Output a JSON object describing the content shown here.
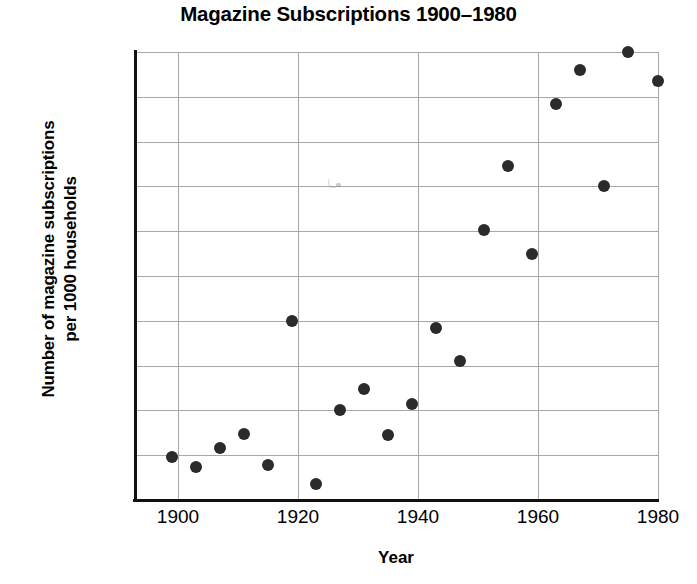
{
  "chart_data": {
    "type": "scatter",
    "title": "Magazine Subscriptions 1900–1980",
    "xlabel": "Year",
    "ylabel": "Number of magazine subscriptions per 1000 households",
    "ylabel_lines": [
      "Number of magazine subscriptions",
      "per 1000 households"
    ],
    "xlim": [
      1893,
      1980
    ],
    "ylim": [
      0,
      100
    ],
    "xticks": [
      1900,
      1920,
      1940,
      1960,
      1980
    ],
    "xtick_labels": [
      "1900",
      "1920",
      "1940",
      "1960",
      "1980"
    ],
    "yticks": [
      0,
      10,
      20,
      30,
      40,
      50,
      60,
      70,
      80,
      90,
      100
    ],
    "ytick_labels": [
      "0",
      "10",
      "20",
      "30",
      "40",
      "50",
      "60",
      "70",
      "80",
      "90",
      "100"
    ],
    "grid": "both",
    "legend": null,
    "marker": "filled-circle",
    "marker_color": "#2b2b2b",
    "grid_color": "#a8a8a8",
    "axis_color": "#111111",
    "points": [
      {
        "x": 1899,
        "y": 9.6
      },
      {
        "x": 1903,
        "y": 7.4
      },
      {
        "x": 1907,
        "y": 11.7
      },
      {
        "x": 1911,
        "y": 14.8
      },
      {
        "x": 1915,
        "y": 7.8
      },
      {
        "x": 1919,
        "y": 40.0
      },
      {
        "x": 1923,
        "y": 3.5
      },
      {
        "x": 1927,
        "y": 20.0
      },
      {
        "x": 1931,
        "y": 24.8
      },
      {
        "x": 1935,
        "y": 14.5
      },
      {
        "x": 1939,
        "y": 21.5
      },
      {
        "x": 1943,
        "y": 38.5
      },
      {
        "x": 1947,
        "y": 31.0
      },
      {
        "x": 1951,
        "y": 60.3
      },
      {
        "x": 1955,
        "y": 74.5
      },
      {
        "x": 1959,
        "y": 55.0
      },
      {
        "x": 1963,
        "y": 88.5
      },
      {
        "x": 1967,
        "y": 96.0
      },
      {
        "x": 1971,
        "y": 70.2
      },
      {
        "x": 1975,
        "y": 100.0
      },
      {
        "x": 1980,
        "y": 93.5
      }
    ]
  }
}
